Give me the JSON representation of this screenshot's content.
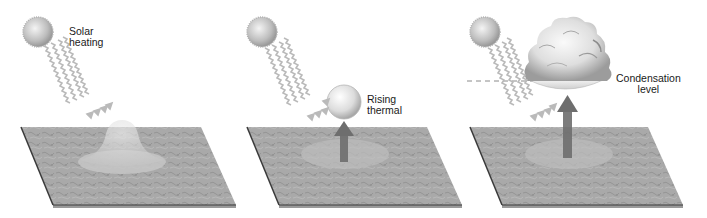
{
  "diagram": {
    "colors": {
      "background": "#ffffff",
      "ground": "#a8a8a8",
      "ground_dark": "#8c8c8c",
      "ground_edge": "#3a3a3a",
      "footprint": "#c4c4c4",
      "sun": "#cfcfcf",
      "rays": "#b8b8b8",
      "arrow": "#6e6e6e",
      "thermal": "#e2e2e2",
      "cloud": "#dcdcdc",
      "text": "#1a1a1a"
    },
    "stages": [
      {
        "id": "stage-1",
        "label": "Solar\nheating",
        "elements": [
          "sun",
          "solar-rays",
          "ground-plane",
          "heated-air-bubble"
        ]
      },
      {
        "id": "stage-2",
        "label": "Rising\nthermal",
        "elements": [
          "sun",
          "solar-rays",
          "ground-plane",
          "thermal-sphere",
          "upward-arrow"
        ]
      },
      {
        "id": "stage-3",
        "label": "Condensation\nlevel",
        "elements": [
          "sun",
          "solar-rays",
          "ground-plane",
          "cumulus-cloud",
          "upward-arrow",
          "condensation-level-line"
        ]
      }
    ]
  }
}
